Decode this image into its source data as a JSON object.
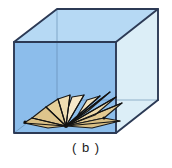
{
  "figure": {
    "caption": "( b )",
    "alt_label": "b",
    "colors": {
      "cube_front_face": "#8CBDEA",
      "cube_top_face": "#AFD4F2",
      "cube_right_face": "#DCEEF7",
      "cube_back_left_face": "#B9DCF3",
      "cube_edge": "#2C3A55",
      "plane_fill_light": "#F6E6C2",
      "plane_fill_mid": "#EAD29B",
      "plane_fill_dark": "#D9BE84",
      "plane_edge": "#1A1A1A",
      "background": "#FFFFFF"
    },
    "cube_vertices": {
      "front_top_left": [
        14,
        42
      ],
      "front_top_right": [
        116,
        42
      ],
      "front_bottom_left": [
        14,
        133
      ],
      "front_bottom_right": [
        116,
        133
      ],
      "back_top_left": [
        57,
        9
      ],
      "back_top_right": [
        158,
        9
      ],
      "back_bottom_right": [
        158,
        100
      ],
      "back_bottom_left": [
        57,
        100
      ]
    },
    "fan": {
      "apex": [
        66,
        126
      ],
      "blade_count": 7,
      "description": "half-planes radiating about a common line, like open book pages"
    }
  }
}
